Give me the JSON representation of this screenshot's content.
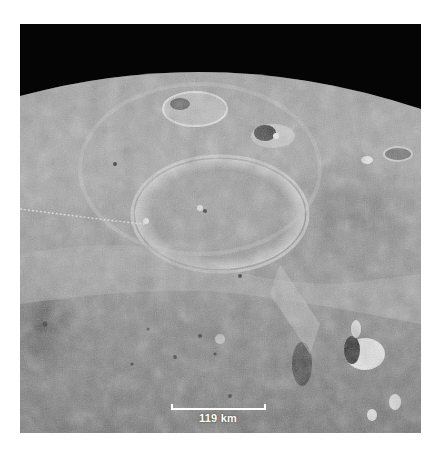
{
  "image": {
    "subject": "oblique view of lunar surface with large impact basin and craters",
    "palette": {
      "space": "#050505",
      "highlands": "#b8b8b8",
      "mare": "#7a7a7a",
      "bright_rim": "#e6e6e6",
      "shadow": "#2a2a2a"
    }
  },
  "scale_bar": {
    "label": "119 km",
    "color": "#ffffff"
  }
}
